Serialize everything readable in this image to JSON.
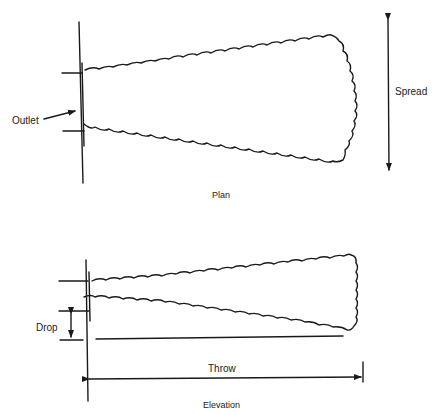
{
  "diagram": {
    "plan": {
      "caption": "Plan",
      "labels": {
        "outlet": "Outlet",
        "spread": "Spread"
      }
    },
    "elevation": {
      "caption": "Elevation",
      "labels": {
        "drop": "Drop",
        "throw": "Throw"
      }
    },
    "colors": {
      "ink": "#1a1a1a",
      "background": "#ffffff"
    }
  }
}
